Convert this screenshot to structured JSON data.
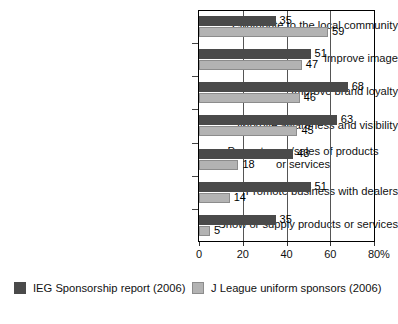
{
  "chart_data": {
    "type": "bar",
    "orientation": "horizontal",
    "title": "",
    "xlabel": "%",
    "ylabel": "",
    "xlim": [
      0,
      80
    ],
    "xticks": [
      0,
      20,
      40,
      60,
      80
    ],
    "grid": true,
    "gridlines_at": [
      20,
      40,
      60
    ],
    "legend_position": "bottom",
    "categories": [
      "Contribute to the local community",
      "Improve image",
      "Improve brand loyalty",
      "Improve awareness and visibility",
      "Promote use/sales of products or services",
      "Promote business with dealers",
      "Show or supply products or services"
    ],
    "category_lines": [
      [
        "Contribute to the local community"
      ],
      [
        "Improve image"
      ],
      [
        "Improve brand loyalty"
      ],
      [
        "Improve awareness and visibility"
      ],
      [
        "Promote use/sales of products",
        "or services"
      ],
      [
        "Promote business with dealers"
      ],
      [
        "Show or supply products or services"
      ]
    ],
    "series": [
      {
        "name": "IEG Sponsorship report (2006)",
        "color": "#4a4a4a",
        "values": [
          35,
          51,
          68,
          63,
          43,
          51,
          35
        ]
      },
      {
        "name": "J League uniform sponsors (2006)",
        "color": "#b3b3b3",
        "values": [
          59,
          47,
          46,
          45,
          18,
          14,
          5
        ]
      }
    ]
  },
  "axis": {
    "tick_labels": [
      "0",
      "20",
      "40",
      "60",
      "80"
    ],
    "unit": "%"
  },
  "legend": {
    "items": [
      {
        "label": "IEG Sponsorship report (2006)",
        "swatch": "dark-gray-swatch"
      },
      {
        "label": "J League uniform sponsors (2006)",
        "swatch": "light-gray-swatch"
      }
    ]
  }
}
